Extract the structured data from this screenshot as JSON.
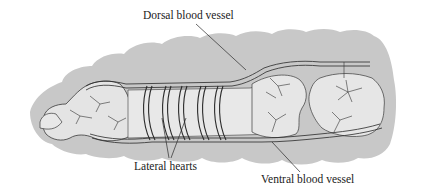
{
  "figure": {
    "colors": {
      "body_outline": "#c8c8c8",
      "gut": "#e6e6e6",
      "vessel_fill": "#f2f2f2",
      "ink": "#2a2a2a",
      "background": "#ffffff"
    }
  },
  "labels": {
    "dorsal": "Dorsal blood vessel",
    "lateral": "Lateral hearts",
    "ventral": "Ventral blood vessel"
  }
}
